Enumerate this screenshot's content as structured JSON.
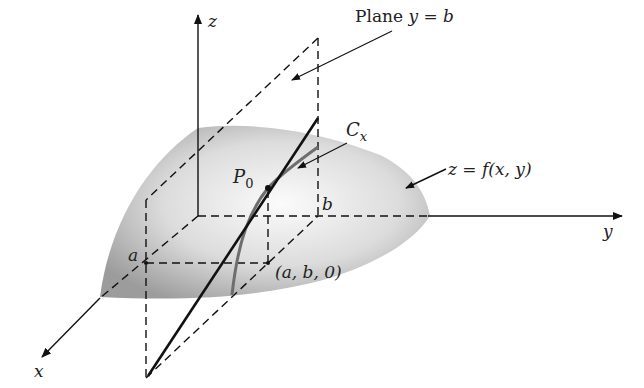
{
  "figure": {
    "labels": {
      "z_axis": "z",
      "y_axis": "y",
      "x_axis": "x",
      "plane": "Plane y = b",
      "plane_prefix": "Plane ",
      "plane_eq": "y = b",
      "curve": "C",
      "curve_sub": "x",
      "surface": "z = f(x, y)",
      "point": "P",
      "point_sub": "0",
      "a": "a",
      "b": "b",
      "base_point": "(a, b, 0)"
    },
    "colors": {
      "line": "#111111",
      "surface_light": "#f4f4f4",
      "surface_dark": "#9a9a9a",
      "curve": "#6e6e6e",
      "background": "#ffffff"
    }
  }
}
